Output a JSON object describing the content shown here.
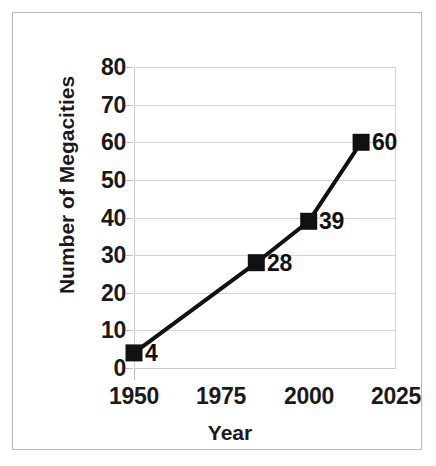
{
  "chart_data": {
    "type": "line",
    "title": "",
    "xlabel": "Year",
    "ylabel": "Number of Megacities",
    "x": [
      1950,
      1985,
      2000,
      2015
    ],
    "values": [
      4,
      28,
      39,
      60
    ],
    "point_labels": [
      "4",
      "28",
      "39",
      "60"
    ],
    "series": [
      {
        "name": "Number of Megacities",
        "x": [
          1950,
          1985,
          2000,
          2015
        ],
        "values": [
          4,
          28,
          39,
          60
        ]
      }
    ],
    "xlim": [
      1950,
      2025
    ],
    "ylim": [
      0,
      80
    ],
    "yticks": [
      "0",
      "10",
      "20",
      "30",
      "40",
      "50",
      "60",
      "70",
      "80"
    ],
    "ytick_values": [
      0,
      10,
      20,
      30,
      40,
      50,
      60,
      70,
      80
    ],
    "xticks": [
      "1950",
      "1975",
      "2000",
      "2025"
    ],
    "xtick_values": [
      1950,
      1975,
      2000,
      2025
    ],
    "grid": "horizontal",
    "legend": "none",
    "marker": "square",
    "marker_color": "#111111",
    "line_color": "#111111"
  },
  "figure": {
    "border_color": "#b9b9b9",
    "background": "#ffffff",
    "gridline_color": "#d2d2d2"
  }
}
